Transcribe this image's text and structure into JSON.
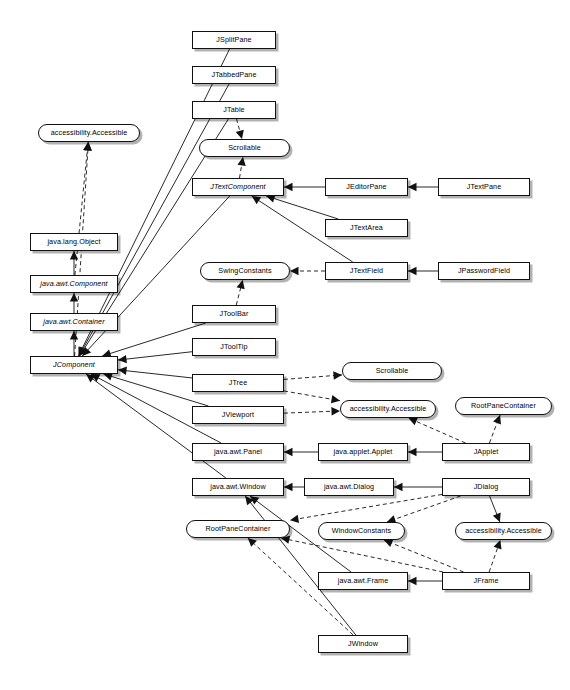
{
  "diagram": {
    "type": "uml-class-diagram",
    "legend": {
      "class_shape": "rectangle",
      "interface_shape": "rounded-rectangle",
      "abstract_style": "italic",
      "generalization": "solid line with hollow/solid triangle arrowhead",
      "realization": "dashed line with triangle arrowhead"
    },
    "colors": {
      "node_fill": "#ffffff",
      "stroke": "#111111",
      "shadow": "#4d4d4d"
    },
    "nodes": [
      {
        "id": "accessible_top",
        "label": "accessibility.Accessible",
        "kind": "interface",
        "abstract": false,
        "x": 38,
        "y": 124,
        "w": 102,
        "h": 18
      },
      {
        "id": "object",
        "label": "java.lang.Object",
        "kind": "class",
        "abstract": false,
        "x": 30,
        "y": 233,
        "w": 88,
        "h": 18
      },
      {
        "id": "awtcomponent",
        "label": "java.awt.Component",
        "kind": "class",
        "abstract": true,
        "x": 30,
        "y": 275,
        "w": 88,
        "h": 18
      },
      {
        "id": "awtcontainer",
        "label": "java.awt.Container",
        "kind": "class",
        "abstract": true,
        "x": 30,
        "y": 313,
        "w": 88,
        "h": 18
      },
      {
        "id": "jcomponent",
        "label": "JComponent",
        "kind": "class",
        "abstract": true,
        "x": 30,
        "y": 356,
        "w": 88,
        "h": 18
      },
      {
        "id": "jsplitpane",
        "label": "JSplitPane",
        "kind": "class",
        "abstract": false,
        "x": 192,
        "y": 31,
        "w": 84,
        "h": 18
      },
      {
        "id": "jtabbedpane",
        "label": "JTabbedPane",
        "kind": "class",
        "abstract": false,
        "x": 192,
        "y": 66,
        "w": 84,
        "h": 18
      },
      {
        "id": "jtable",
        "label": "JTable",
        "kind": "class",
        "abstract": false,
        "x": 192,
        "y": 101,
        "w": 84,
        "h": 18
      },
      {
        "id": "scrollable_top",
        "label": "Scrollable",
        "kind": "interface",
        "abstract": false,
        "x": 199,
        "y": 139,
        "w": 91,
        "h": 18
      },
      {
        "id": "jtextcomponent",
        "label": "JTextComponent",
        "kind": "class",
        "abstract": true,
        "x": 192,
        "y": 178,
        "w": 92,
        "h": 18
      },
      {
        "id": "swingconstants",
        "label": "SwingConstants",
        "kind": "interface",
        "abstract": false,
        "x": 200,
        "y": 262,
        "w": 90,
        "h": 18
      },
      {
        "id": "jtoolbar",
        "label": "JToolBar",
        "kind": "class",
        "abstract": false,
        "x": 192,
        "y": 305,
        "w": 84,
        "h": 18
      },
      {
        "id": "jtooltip",
        "label": "JToolTip",
        "kind": "class",
        "abstract": false,
        "x": 192,
        "y": 338,
        "w": 84,
        "h": 18
      },
      {
        "id": "jtree",
        "label": "JTree",
        "kind": "class",
        "abstract": false,
        "x": 192,
        "y": 374,
        "w": 92,
        "h": 18
      },
      {
        "id": "jviewport",
        "label": "JViewport",
        "kind": "class",
        "abstract": false,
        "x": 192,
        "y": 406,
        "w": 92,
        "h": 18
      },
      {
        "id": "awtpanel",
        "label": "java.awt.Panel",
        "kind": "class",
        "abstract": false,
        "x": 192,
        "y": 443,
        "w": 92,
        "h": 18
      },
      {
        "id": "awtwindow",
        "label": "java.awt.Window",
        "kind": "class",
        "abstract": false,
        "x": 192,
        "y": 478,
        "w": 92,
        "h": 18
      },
      {
        "id": "rpc_left",
        "label": "RootPaneContainer",
        "kind": "interface",
        "abstract": false,
        "x": 186,
        "y": 520,
        "w": 104,
        "h": 18
      },
      {
        "id": "jeditorpane",
        "label": "JEditorPane",
        "kind": "class",
        "abstract": false,
        "x": 325,
        "y": 178,
        "w": 83,
        "h": 18
      },
      {
        "id": "jtextarea",
        "label": "JTextArea",
        "kind": "class",
        "abstract": false,
        "x": 325,
        "y": 219,
        "w": 83,
        "h": 18
      },
      {
        "id": "jtextfield",
        "label": "JTextField",
        "kind": "class",
        "abstract": false,
        "x": 325,
        "y": 262,
        "w": 83,
        "h": 18
      },
      {
        "id": "accessible_mid",
        "label": "accessibility.Accessible",
        "kind": "interface",
        "abstract": false,
        "x": 340,
        "y": 400,
        "w": 96,
        "h": 18
      },
      {
        "id": "appletcls",
        "label": "java.applet.Applet",
        "kind": "class",
        "abstract": false,
        "x": 318,
        "y": 443,
        "w": 90,
        "h": 18
      },
      {
        "id": "awtdialog",
        "label": "java.awt.Dialog",
        "kind": "class",
        "abstract": false,
        "x": 304,
        "y": 478,
        "w": 90,
        "h": 18
      },
      {
        "id": "windowconstants",
        "label": "WindowConstants",
        "kind": "interface",
        "abstract": false,
        "x": 318,
        "y": 522,
        "w": 87,
        "h": 18
      },
      {
        "id": "awtframe",
        "label": "java.awt.Frame",
        "kind": "class",
        "abstract": false,
        "x": 318,
        "y": 572,
        "w": 90,
        "h": 18
      },
      {
        "id": "jwindow",
        "label": "JWindow",
        "kind": "class",
        "abstract": false,
        "x": 318,
        "y": 635,
        "w": 90,
        "h": 18
      },
      {
        "id": "scrollable_right",
        "label": "Scrollable",
        "kind": "interface",
        "abstract": false,
        "x": 342,
        "y": 362,
        "w": 100,
        "h": 18
      },
      {
        "id": "jtextpane",
        "label": "JTextPane",
        "kind": "class",
        "abstract": false,
        "x": 438,
        "y": 178,
        "w": 92,
        "h": 18
      },
      {
        "id": "jpasswordfield",
        "label": "JPasswordField",
        "kind": "class",
        "abstract": false,
        "x": 438,
        "y": 262,
        "w": 92,
        "h": 18
      },
      {
        "id": "rpc_right",
        "label": "RootPaneContainer",
        "kind": "interface",
        "abstract": false,
        "x": 455,
        "y": 397,
        "w": 97,
        "h": 18
      },
      {
        "id": "japplet",
        "label": "JApplet",
        "kind": "class",
        "abstract": false,
        "x": 442,
        "y": 443,
        "w": 88,
        "h": 18
      },
      {
        "id": "jdialog",
        "label": "JDialog",
        "kind": "class",
        "abstract": false,
        "x": 442,
        "y": 478,
        "w": 88,
        "h": 18
      },
      {
        "id": "accessible_low",
        "label": "accessibility.Accessible",
        "kind": "interface",
        "abstract": false,
        "x": 455,
        "y": 522,
        "w": 97,
        "h": 18
      },
      {
        "id": "jframe",
        "label": "JFrame",
        "kind": "class",
        "abstract": false,
        "x": 442,
        "y": 572,
        "w": 88,
        "h": 18
      }
    ],
    "edges": [
      {
        "from": "awtcomponent",
        "to": "object",
        "style": "solid",
        "relation": "generalization"
      },
      {
        "from": "awtcontainer",
        "to": "awtcomponent",
        "style": "solid",
        "relation": "generalization"
      },
      {
        "from": "jcomponent",
        "to": "awtcontainer",
        "style": "solid",
        "relation": "generalization"
      },
      {
        "from": "awtcomponent",
        "to": "accessible_top",
        "style": "dashed",
        "relation": "realization"
      },
      {
        "from": "jcomponent",
        "to": "accessible_top",
        "style": "dashed",
        "relation": "realization"
      },
      {
        "from": "jsplitpane",
        "to": "jcomponent",
        "style": "solid",
        "relation": "generalization"
      },
      {
        "from": "jtabbedpane",
        "to": "jcomponent",
        "style": "solid",
        "relation": "generalization"
      },
      {
        "from": "jtable",
        "to": "jcomponent",
        "style": "solid",
        "relation": "generalization"
      },
      {
        "from": "jtable",
        "to": "scrollable_top",
        "style": "dashed",
        "relation": "realization"
      },
      {
        "from": "jtextcomponent",
        "to": "jcomponent",
        "style": "solid",
        "relation": "generalization"
      },
      {
        "from": "jtextcomponent",
        "to": "scrollable_top",
        "style": "dashed",
        "relation": "realization"
      },
      {
        "from": "jeditorpane",
        "to": "jtextcomponent",
        "style": "solid",
        "relation": "generalization"
      },
      {
        "from": "jtextarea",
        "to": "jtextcomponent",
        "style": "solid",
        "relation": "generalization"
      },
      {
        "from": "jtextfield",
        "to": "jtextcomponent",
        "style": "solid",
        "relation": "generalization"
      },
      {
        "from": "jtextpane",
        "to": "jeditorpane",
        "style": "solid",
        "relation": "generalization"
      },
      {
        "from": "jpasswordfield",
        "to": "jtextfield",
        "style": "solid",
        "relation": "generalization"
      },
      {
        "from": "jtextfield",
        "to": "swingconstants",
        "style": "dashed",
        "relation": "realization"
      },
      {
        "from": "jtoolbar",
        "to": "swingconstants",
        "style": "dashed",
        "relation": "realization"
      },
      {
        "from": "jtoolbar",
        "to": "jcomponent",
        "style": "solid",
        "relation": "generalization"
      },
      {
        "from": "jtooltip",
        "to": "jcomponent",
        "style": "solid",
        "relation": "generalization"
      },
      {
        "from": "jtree",
        "to": "jcomponent",
        "style": "solid",
        "relation": "generalization"
      },
      {
        "from": "jtree",
        "to": "scrollable_right",
        "style": "dashed",
        "relation": "realization"
      },
      {
        "from": "jtree",
        "to": "accessible_mid",
        "style": "dashed",
        "relation": "realization"
      },
      {
        "from": "jviewport",
        "to": "jcomponent",
        "style": "solid",
        "relation": "generalization"
      },
      {
        "from": "jviewport",
        "to": "accessible_mid",
        "style": "dashed",
        "relation": "realization"
      },
      {
        "from": "awtpanel",
        "to": "jcomponent",
        "style": "solid",
        "relation": "generalization"
      },
      {
        "from": "appletcls",
        "to": "awtpanel",
        "style": "solid",
        "relation": "generalization"
      },
      {
        "from": "japplet",
        "to": "appletcls",
        "style": "solid",
        "relation": "generalization"
      },
      {
        "from": "japplet",
        "to": "accessible_mid",
        "style": "dashed",
        "relation": "realization"
      },
      {
        "from": "japplet",
        "to": "rpc_right",
        "style": "dashed",
        "relation": "realization"
      },
      {
        "from": "awtwindow",
        "to": "jcomponent",
        "style": "solid",
        "relation": "generalization"
      },
      {
        "from": "awtdialog",
        "to": "awtwindow",
        "style": "solid",
        "relation": "generalization"
      },
      {
        "from": "jdialog",
        "to": "awtdialog",
        "style": "solid",
        "relation": "generalization"
      },
      {
        "from": "jdialog",
        "to": "accessible_low",
        "style": "solid",
        "relation": "generalization"
      },
      {
        "from": "jdialog",
        "to": "rpc_left",
        "style": "dashed",
        "relation": "realization"
      },
      {
        "from": "jdialog",
        "to": "windowconstants",
        "style": "dashed",
        "relation": "realization"
      },
      {
        "from": "awtframe",
        "to": "awtwindow",
        "style": "solid",
        "relation": "generalization"
      },
      {
        "from": "jframe",
        "to": "awtframe",
        "style": "solid",
        "relation": "generalization"
      },
      {
        "from": "jframe",
        "to": "accessible_low",
        "style": "dashed",
        "relation": "realization"
      },
      {
        "from": "jframe",
        "to": "windowconstants",
        "style": "dashed",
        "relation": "realization"
      },
      {
        "from": "jframe",
        "to": "rpc_left",
        "style": "dashed",
        "relation": "realization"
      },
      {
        "from": "jwindow",
        "to": "awtwindow",
        "style": "solid",
        "relation": "generalization"
      },
      {
        "from": "jwindow",
        "to": "rpc_left",
        "style": "dashed",
        "relation": "realization"
      }
    ]
  }
}
